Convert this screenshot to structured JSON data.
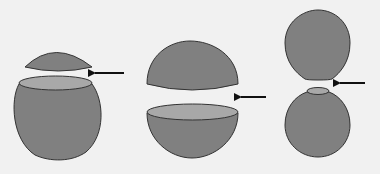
{
  "diagram": {
    "colors": {
      "background": "#f1f1f1",
      "body_fill": "#808080",
      "cut_face_fill": "#a8a8a8",
      "outline": "#333333",
      "arrow": "#111111"
    },
    "panels": [
      {
        "id": "panel-1",
        "label": "small-cap-split"
      },
      {
        "id": "panel-2",
        "label": "hemisphere-split"
      },
      {
        "id": "panel-3",
        "label": "pinched-split"
      }
    ],
    "arrows": [
      {
        "x1": 124,
        "y1": 73,
        "x2": 92,
        "y2": 73
      },
      {
        "x1": 266,
        "y1": 97,
        "x2": 238,
        "y2": 97
      },
      {
        "x1": 365,
        "y1": 83,
        "x2": 337,
        "y2": 83
      }
    ]
  }
}
